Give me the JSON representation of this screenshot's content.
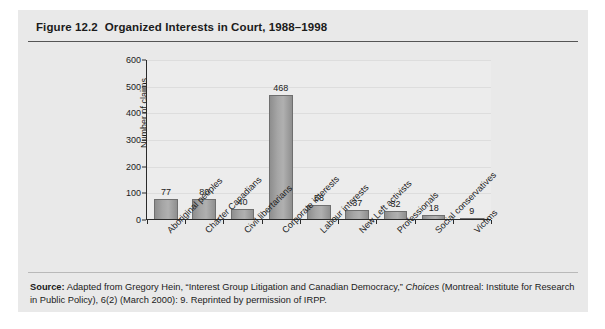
{
  "figure": {
    "number": "Figure 12.2",
    "title": "Organized Interests in Court, 1988–1998"
  },
  "source": {
    "label": "Source:",
    "text_before_italic": " Adapted from Gregory Hein, “Interest Group Litigation and Canadian Democracy,” ",
    "italic": "Choices",
    "text_after_italic": " (Montreal: Institute for Research in Public Policy), 6(2) (March 2000): 9. Reprinted by permission of IRPP."
  },
  "colors": {
    "box_background": "#e9e9e9",
    "plot_background": "#ececec",
    "bar_fill": "#a6a6a6",
    "bar_border": "#6f6f6f",
    "axis": "#2a2a2a",
    "gridline": "#dddddd",
    "text": "#1b1b1b"
  },
  "chart_data": {
    "type": "bar",
    "title": "Organized Interests in Court, 1988–1998",
    "xlabel": "",
    "ylabel": "Number of claims",
    "ylim": [
      0,
      600
    ],
    "yticks": [
      0,
      100,
      200,
      300,
      400,
      500,
      600
    ],
    "ytick_labels": [
      "0",
      "100",
      "200",
      "300",
      "400",
      "500",
      "600"
    ],
    "grid": true,
    "legend": false,
    "data_labels": true,
    "categories": [
      "Aboriginal peoples",
      "Charter Canadians",
      "Civil libertarians",
      "Corporate interests",
      "Labour interests",
      "New Left activists",
      "Professionals",
      "Social conservatives",
      "Victims"
    ],
    "values": [
      77,
      80,
      40,
      468,
      58,
      37,
      32,
      18,
      9
    ],
    "value_labels": [
      "77",
      "80",
      "40",
      "468",
      "58",
      "37",
      "32",
      "18",
      "9"
    ]
  }
}
